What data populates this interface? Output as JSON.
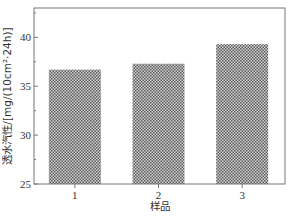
{
  "chart_data": {
    "type": "bar",
    "title": "",
    "xlabel": "样品",
    "ylabel": "透水汽性/[mg/(10cm²·24h)]",
    "categories": [
      "1",
      "2",
      "3"
    ],
    "values": [
      36.7,
      37.3,
      39.3
    ],
    "ylim": [
      25,
      43
    ],
    "yticks": [
      25,
      30,
      35,
      40
    ],
    "ytick_labels": [
      "25",
      "30",
      "35",
      "40"
    ],
    "grid": false,
    "legend": null,
    "bar_fill": "crosshatch pattern (dark gray checkered)"
  },
  "colors": {
    "axis": "#777777",
    "bar_dark": "#555555",
    "bar_light": "#d8d8d8",
    "text": "#333333"
  }
}
